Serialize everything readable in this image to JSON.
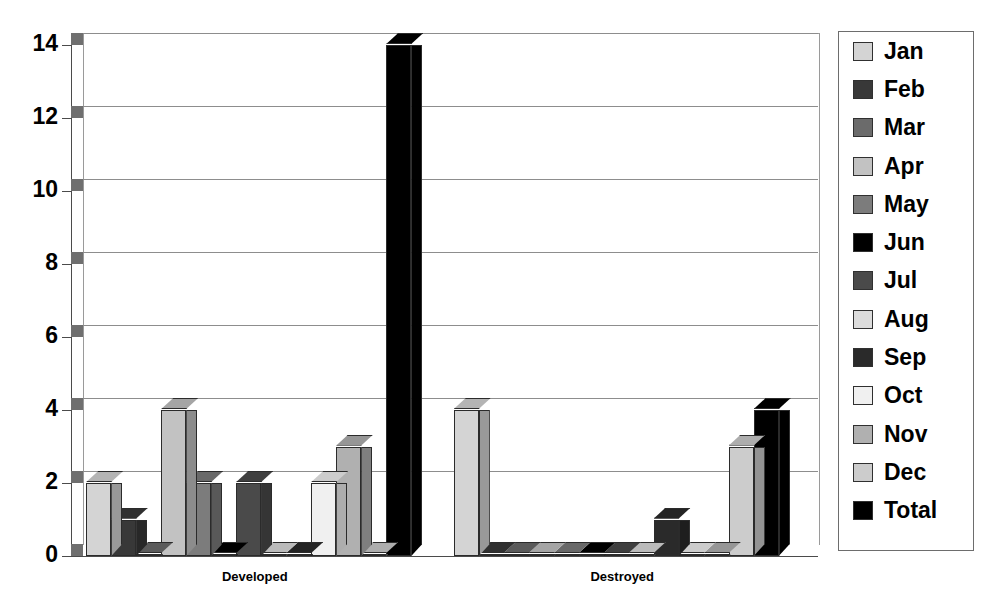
{
  "chart_data": {
    "type": "bar",
    "title": "",
    "xlabel": "",
    "ylabel": "",
    "categories": [
      "Developed",
      "Destroyed"
    ],
    "ylim": [
      0,
      14
    ],
    "yticks": [
      0,
      2,
      4,
      6,
      8,
      10,
      12,
      14
    ],
    "ytick_labels": [
      "0",
      "2",
      "4",
      "6",
      "8",
      "10",
      "12",
      "14"
    ],
    "grid": true,
    "legend_position": "right",
    "style": "3d-clustered-column",
    "series": [
      {
        "name": "Jan",
        "color": "#d4d4d4",
        "values": [
          2,
          4
        ]
      },
      {
        "name": "Feb",
        "color": "#383838",
        "values": [
          1,
          0
        ]
      },
      {
        "name": "Mar",
        "color": "#6b6b6b",
        "values": [
          0,
          0
        ]
      },
      {
        "name": "Apr",
        "color": "#c2c2c2",
        "values": [
          4,
          0
        ]
      },
      {
        "name": "May",
        "color": "#7c7c7c",
        "values": [
          2,
          0
        ]
      },
      {
        "name": "Jun",
        "color": "#000000",
        "values": [
          0,
          0
        ]
      },
      {
        "name": "Jul",
        "color": "#4a4a4a",
        "values": [
          2,
          0
        ]
      },
      {
        "name": "Aug",
        "color": "#dcdcdc",
        "values": [
          0,
          0
        ]
      },
      {
        "name": "Sep",
        "color": "#2a2a2a",
        "values": [
          0,
          1
        ]
      },
      {
        "name": "Oct",
        "color": "#f0f0f0",
        "values": [
          2,
          0
        ]
      },
      {
        "name": "Nov",
        "color": "#b0b0b0",
        "values": [
          3,
          0
        ]
      },
      {
        "name": "Dec",
        "color": "#cccccc",
        "values": [
          0,
          3
        ]
      },
      {
        "name": "Total",
        "color": "#000000",
        "values": [
          14,
          4
        ]
      }
    ]
  },
  "legend": {
    "items": [
      {
        "label": "Jan",
        "swatch": "#d4d4d4"
      },
      {
        "label": "Feb",
        "swatch": "#383838"
      },
      {
        "label": "Mar",
        "swatch": "#6b6b6b"
      },
      {
        "label": "Apr",
        "swatch": "#c2c2c2"
      },
      {
        "label": "May",
        "swatch": "#7c7c7c"
      },
      {
        "label": "Jun",
        "swatch": "#000000"
      },
      {
        "label": "Jul",
        "swatch": "#4a4a4a"
      },
      {
        "label": "Aug",
        "swatch": "#dcdcdc"
      },
      {
        "label": "Sep",
        "swatch": "#2a2a2a"
      },
      {
        "label": "Oct",
        "swatch": "#f0f0f0"
      },
      {
        "label": "Nov",
        "swatch": "#b0b0b0"
      },
      {
        "label": "Dec",
        "swatch": "#cccccc"
      },
      {
        "label": "Total",
        "swatch": "#000000"
      }
    ]
  }
}
